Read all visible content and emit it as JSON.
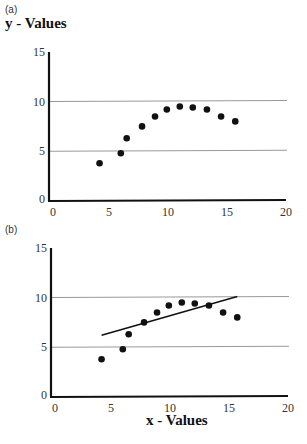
{
  "chart_data": [
    {
      "panel": "(a)",
      "type": "scatter",
      "title": "",
      "ylabel": "y - Values",
      "xlabel": "",
      "xlim": [
        0,
        20
      ],
      "ylim": [
        0,
        15
      ],
      "xticks": [
        0,
        5,
        10,
        15,
        20
      ],
      "yticks": [
        0,
        5,
        10,
        15
      ],
      "grid": {
        "horizontal": [
          5,
          10
        ]
      },
      "series": [
        {
          "name": "data",
          "x": [
            4.2,
            6.0,
            6.5,
            7.8,
            8.9,
            9.9,
            11.0,
            12.1,
            13.3,
            14.5,
            15.7
          ],
          "y": [
            3.8,
            4.8,
            6.3,
            7.5,
            8.5,
            9.2,
            9.5,
            9.4,
            9.2,
            8.5,
            8.0
          ]
        }
      ]
    },
    {
      "panel": "(b)",
      "type": "scatter",
      "title": "",
      "ylabel": "",
      "xlabel": "x - Values",
      "xlim": [
        0,
        20
      ],
      "ylim": [
        0,
        15
      ],
      "xticks": [
        0,
        5,
        10,
        15,
        20
      ],
      "yticks": [
        0,
        5,
        10,
        15
      ],
      "grid": {
        "horizontal": [
          5,
          10
        ]
      },
      "series": [
        {
          "name": "data",
          "x": [
            4.2,
            6.0,
            6.5,
            7.8,
            8.9,
            9.9,
            11.0,
            12.1,
            13.3,
            14.5,
            15.7
          ],
          "y": [
            3.8,
            4.8,
            6.3,
            7.5,
            8.5,
            9.2,
            9.5,
            9.4,
            9.2,
            8.5,
            8.0
          ]
        },
        {
          "name": "linear fit",
          "type": "line",
          "x": [
            4.2,
            15.7
          ],
          "y": [
            6.2,
            10.1
          ]
        }
      ]
    }
  ],
  "labels": {
    "panel_a": "(a)",
    "panel_b": "(b)",
    "y_title": "y - Values",
    "x_title": "x - Values"
  },
  "colors": {
    "points": "#111111",
    "axes": "#111111",
    "grid": "#999999",
    "fit_line": "#111111"
  }
}
